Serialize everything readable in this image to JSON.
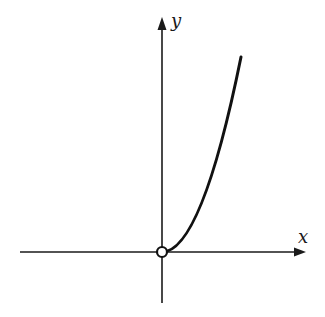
{
  "diagram": {
    "type": "function-graph",
    "axes": {
      "x_label": "x",
      "y_label": "y",
      "color": "#1a1a1a"
    },
    "curve": {
      "description": "increasing concave-up curve starting at origin in first quadrant",
      "color": "#111111"
    },
    "origin_marker": {
      "style": "open-circle",
      "fill": "#ffffff",
      "stroke": "#111111"
    }
  }
}
